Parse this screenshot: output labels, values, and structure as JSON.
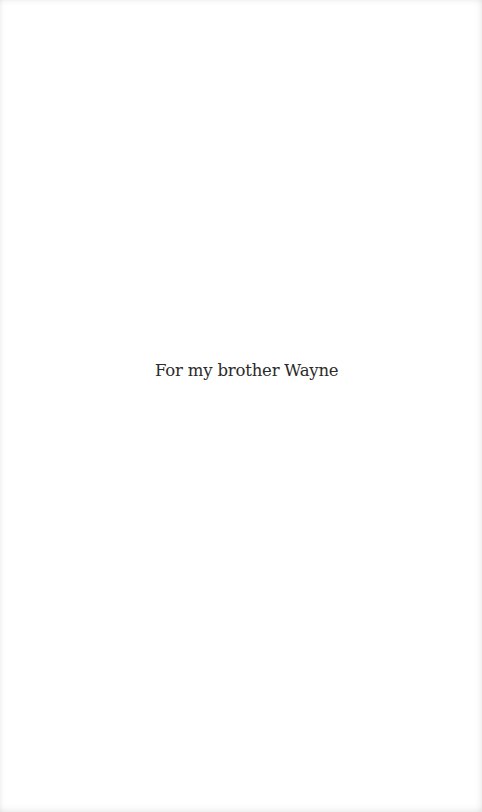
{
  "page": {
    "dedication": "For my brother Wayne"
  }
}
